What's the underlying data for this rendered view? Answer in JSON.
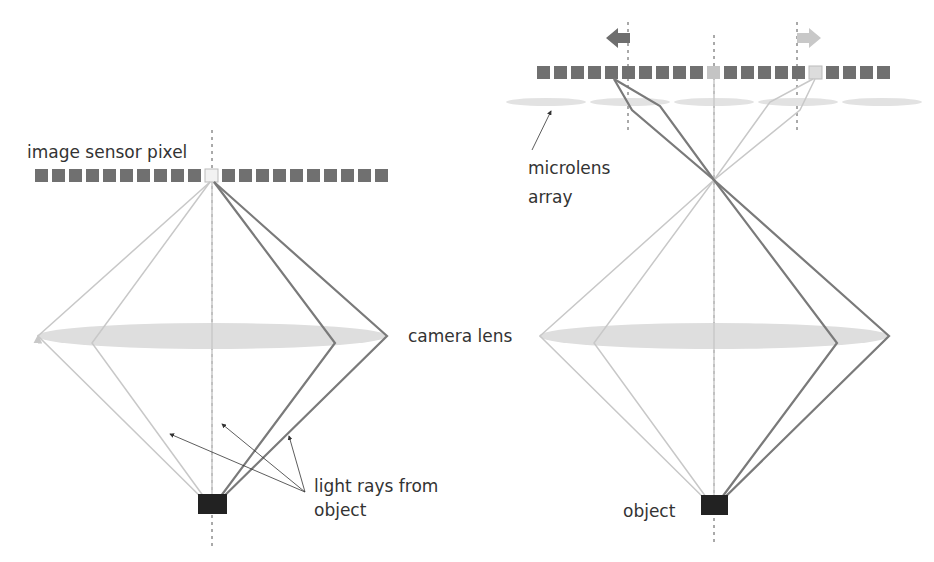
{
  "labels": {
    "image_sensor_pixel": "image sensor pixel",
    "camera_lens": "camera lens",
    "light_rays_line1": "light rays from",
    "light_rays_line2": "object",
    "microlens_line1": "microlens",
    "microlens_line2": "array",
    "object": "object"
  },
  "colors": {
    "sensor_pixel": "#707070",
    "sensor_pixel_highlight_left": "#f2f2f2",
    "sensor_pixel_highlight_right_center": "#c4c4c4",
    "sensor_pixel_highlight_right_offset": "#dcdcdc",
    "dark_ray": "#7a7a7a",
    "light_ray": "#c8c8c8",
    "lens_fill": "#dedede",
    "object_fill": "#222222",
    "arrow_left": "#6e6e6e",
    "arrow_right": "#c8c8c8",
    "text": "#333333"
  },
  "left_diagram": {
    "sensor_pixels_left": 10,
    "sensor_pixels_right": 10,
    "highlighted_pixel": "center"
  },
  "right_diagram": {
    "sensor_pixel_count": 21,
    "highlighted_pixels": [
      10,
      16
    ],
    "microlens_count": 5,
    "shift_arrows": [
      "left",
      "right"
    ]
  }
}
